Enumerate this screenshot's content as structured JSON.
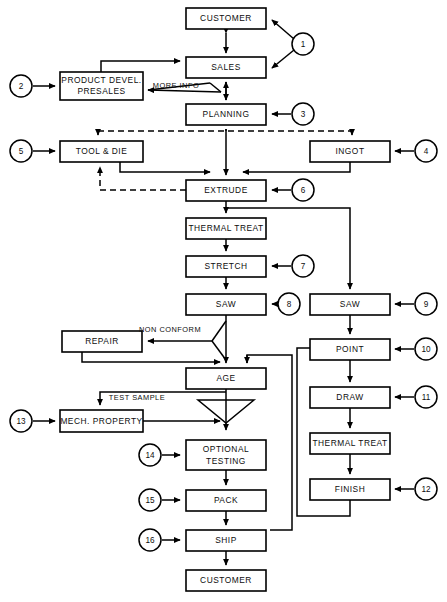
{
  "diagram": {
    "boxes": [
      {
        "id": "customer-top",
        "label": "CUSTOMER",
        "x": 186,
        "y": 8,
        "w": 80,
        "h": 21
      },
      {
        "id": "sales",
        "label": "SALES",
        "x": 186,
        "y": 57,
        "w": 80,
        "h": 21
      },
      {
        "id": "product-devel",
        "label": "PRODUCT DEVEL.",
        "label2": "PRESALES",
        "x": 60,
        "y": 72,
        "w": 83,
        "h": 28
      },
      {
        "id": "planning",
        "label": "PLANNING",
        "x": 186,
        "y": 104,
        "w": 80,
        "h": 21
      },
      {
        "id": "tool-and-die",
        "label": "TOOL & DIE",
        "x": 60,
        "y": 141,
        "w": 83,
        "h": 21
      },
      {
        "id": "ingot",
        "label": "INGOT",
        "x": 310,
        "y": 141,
        "w": 80,
        "h": 21
      },
      {
        "id": "extrude",
        "label": "EXTRUDE",
        "x": 186,
        "y": 180,
        "w": 80,
        "h": 21
      },
      {
        "id": "thermal-treat-left",
        "label": "THERMAL TREAT",
        "x": 186,
        "y": 218,
        "w": 80,
        "h": 21
      },
      {
        "id": "stretch",
        "label": "STRETCH",
        "x": 186,
        "y": 256,
        "w": 80,
        "h": 21
      },
      {
        "id": "saw-left",
        "label": "SAW",
        "x": 186,
        "y": 294,
        "w": 80,
        "h": 21
      },
      {
        "id": "saw-right",
        "label": "SAW",
        "x": 310,
        "y": 294,
        "w": 80,
        "h": 21
      },
      {
        "id": "repair",
        "label": "REPAIR",
        "x": 62,
        "y": 331,
        "w": 80,
        "h": 21
      },
      {
        "id": "point",
        "label": "POINT",
        "x": 310,
        "y": 339,
        "w": 80,
        "h": 21
      },
      {
        "id": "age",
        "label": "AGE",
        "x": 186,
        "y": 368,
        "w": 80,
        "h": 21
      },
      {
        "id": "draw",
        "label": "DRAW",
        "x": 310,
        "y": 387,
        "w": 80,
        "h": 21
      },
      {
        "id": "mech-property",
        "label": "MECH. PROPERTY",
        "x": 60,
        "y": 410,
        "w": 83,
        "h": 22
      },
      {
        "id": "thermal-treat-right",
        "label": "THERMAL TREAT",
        "x": 310,
        "y": 433,
        "w": 80,
        "h": 21
      },
      {
        "id": "optional-testing",
        "label": "OPTIONAL",
        "label2": "TESTING",
        "x": 186,
        "y": 440,
        "w": 80,
        "h": 30
      },
      {
        "id": "finish",
        "label": "FINISH",
        "x": 310,
        "y": 479,
        "w": 80,
        "h": 21
      },
      {
        "id": "pack",
        "label": "PACK",
        "x": 186,
        "y": 490,
        "w": 80,
        "h": 21
      },
      {
        "id": "ship",
        "label": "SHIP",
        "x": 186,
        "y": 530,
        "w": 80,
        "h": 21
      },
      {
        "id": "customer-bottom",
        "label": "CUSTOMER",
        "x": 186,
        "y": 570,
        "w": 80,
        "h": 21
      }
    ],
    "callouts": [
      {
        "id": "callout-1",
        "number": "1",
        "cx": 303,
        "cy": 44,
        "r": 11
      },
      {
        "id": "callout-2",
        "number": "2",
        "cx": 21,
        "cy": 86,
        "r": 11
      },
      {
        "id": "callout-3",
        "number": "3",
        "cx": 303,
        "cy": 114,
        "r": 11
      },
      {
        "id": "callout-4",
        "number": "4",
        "cx": 426,
        "cy": 151,
        "r": 11
      },
      {
        "id": "callout-5",
        "number": "5",
        "cx": 21,
        "cy": 151,
        "r": 11
      },
      {
        "id": "callout-6",
        "number": "6",
        "cx": 303,
        "cy": 190,
        "r": 11
      },
      {
        "id": "callout-7",
        "number": "7",
        "cx": 303,
        "cy": 266,
        "r": 11
      },
      {
        "id": "callout-8",
        "number": "8",
        "cx": 289,
        "cy": 304,
        "r": 11
      },
      {
        "id": "callout-9",
        "number": "9",
        "cx": 426,
        "cy": 304,
        "r": 11
      },
      {
        "id": "callout-10",
        "number": "10",
        "cx": 426,
        "cy": 349,
        "r": 11
      },
      {
        "id": "callout-11",
        "number": "11",
        "cx": 426,
        "cy": 397,
        "r": 11
      },
      {
        "id": "callout-12",
        "number": "12",
        "cx": 426,
        "cy": 489,
        "r": 11
      },
      {
        "id": "callout-13",
        "number": "13",
        "cx": 21,
        "cy": 421,
        "r": 11
      },
      {
        "id": "callout-14",
        "number": "14",
        "cx": 150,
        "cy": 455,
        "r": 11
      },
      {
        "id": "callout-15",
        "number": "15",
        "cx": 150,
        "cy": 500,
        "r": 11
      },
      {
        "id": "callout-16",
        "number": "16",
        "cx": 150,
        "cy": 540,
        "r": 11
      }
    ],
    "edge_labels": [
      {
        "id": "more-info",
        "text": "MORE INFO",
        "x": 176,
        "y": 86
      },
      {
        "id": "non-conform",
        "text": "NON CONFORM",
        "x": 170,
        "y": 330
      },
      {
        "id": "test-sample",
        "text": "TEST SAMPLE",
        "x": 137,
        "y": 398
      }
    ]
  }
}
